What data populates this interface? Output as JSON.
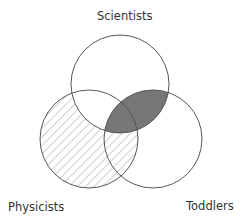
{
  "diagram": {
    "type": "venn",
    "sets": [
      {
        "id": "scientists",
        "label": "Scientists",
        "cx": 120,
        "cy": 84,
        "r": 49
      },
      {
        "id": "physicists",
        "label": "Physicists",
        "cx": 89,
        "cy": 139,
        "r": 49
      },
      {
        "id": "toddlers",
        "label": "Toddlers",
        "cx": 153,
        "cy": 139,
        "r": 49
      }
    ],
    "regions": [
      {
        "region": "scientists ∩ toddlers",
        "style": "solid-fill",
        "color": "#777777"
      },
      {
        "region": "physicists − scientists",
        "style": "diagonal-hatch",
        "color": "#b0b0b0"
      }
    ],
    "colors": {
      "stroke": "#555555",
      "solid_fill": "#777777",
      "hatch": "#b5b5b5",
      "background": "#ffffff"
    }
  }
}
